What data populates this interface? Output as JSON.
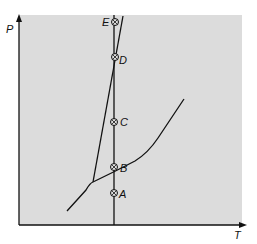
{
  "diagram": {
    "type": "phase diagram",
    "axes": {
      "x_label": "T",
      "y_label": "P"
    },
    "colors": {
      "background": "#dcdcdc",
      "line": "#111111"
    },
    "points": [
      {
        "label": "E",
        "x": 114,
        "y": 22
      },
      {
        "label": "D",
        "x": 114,
        "y": 57
      },
      {
        "label": "C",
        "x": 114,
        "y": 122
      },
      {
        "label": "B",
        "x": 114,
        "y": 167
      },
      {
        "label": "A",
        "x": 114,
        "y": 193
      }
    ]
  }
}
